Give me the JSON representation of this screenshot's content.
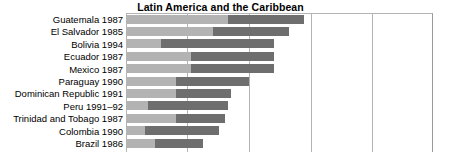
{
  "chart_data": {
    "type": "bar",
    "title": "Latin America and the Caribbean",
    "xlabel": "",
    "ylabel": "",
    "orientation": "horizontal",
    "stacked": true,
    "grid": true,
    "legend_position": "none",
    "xlim": [
      0,
      100
    ],
    "xticks": [
      0,
      20,
      40,
      60,
      80,
      100
    ],
    "categories": [
      "Guatemala 1987",
      "El Salvador 1985",
      "Bolivia 1994",
      "Ecuador 1987",
      "Mexico 1987",
      "Paraguay 1990",
      "Dominican Republic 1991",
      "Peru 1991–92",
      "Trinidad and Tobago 1987",
      "Colombia 1990",
      "Brazil 1986"
    ],
    "series": [
      {
        "name": "segment-1",
        "color": "#b3b3b3",
        "values": [
          33,
          28,
          11,
          21,
          21,
          16,
          16,
          7,
          16,
          6,
          9
        ]
      },
      {
        "name": "segment-2",
        "color": "#6e6e6e",
        "values": [
          25,
          25,
          37,
          27,
          27,
          24,
          18,
          26,
          16,
          24,
          16
        ]
      }
    ],
    "totals": [
      58,
      53,
      48,
      48,
      48,
      40,
      34,
      33,
      32,
      30,
      25
    ]
  },
  "axis": {
    "gridline_positions": [
      60,
      122,
      184,
      245,
      306
    ]
  }
}
